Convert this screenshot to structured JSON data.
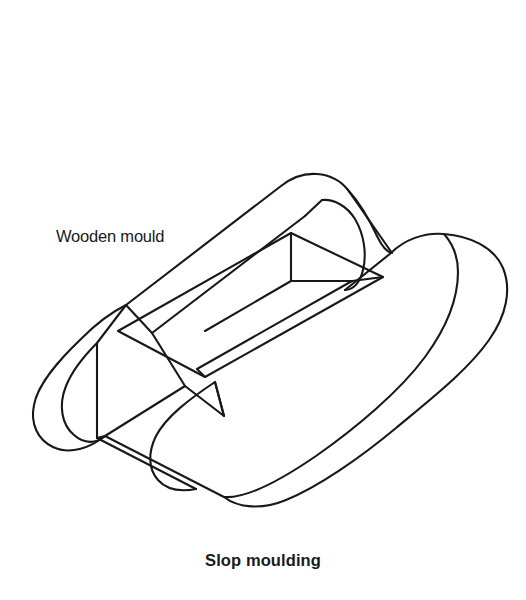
{
  "figure": {
    "caption": "Slop moulding",
    "annotations": [
      {
        "id": "wooden-mould",
        "text": "Wooden mould"
      }
    ],
    "footer_note": "",
    "colors": {
      "background": "#ffffff",
      "stroke": "#181818",
      "fill": "#ffffff",
      "text": "#1a1a1a"
    },
    "stroke_width": 2.1,
    "drawing": {
      "type": "line-art-isometric",
      "subject": "wooden brick mould",
      "parts": [
        "outer-frame-top-face",
        "rounded-handle-left-end",
        "rounded-handle-right-end",
        "inner-cavity",
        "inner-vertical-corner-edge",
        "front-lower-side-faces"
      ]
    }
  }
}
